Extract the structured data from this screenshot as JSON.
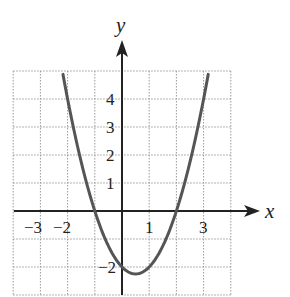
{
  "chart_data": {
    "type": "line",
    "title": "",
    "function": "y = x^2 - x - 2",
    "xlabel": "x",
    "ylabel": "y",
    "xlim": [
      -4,
      4
    ],
    "ylim": [
      -3,
      5
    ],
    "grid": true,
    "grid_style": "dotted",
    "x_tick_labels": [
      {
        "value": -3,
        "label": "−3"
      },
      {
        "value": -2,
        "label": "−2"
      },
      {
        "value": 1,
        "label": "1"
      },
      {
        "value": 3,
        "label": "3"
      }
    ],
    "y_tick_labels": [
      {
        "value": 4,
        "label": "4"
      },
      {
        "value": 3,
        "label": "3"
      },
      {
        "value": 2,
        "label": "2"
      },
      {
        "value": 1,
        "label": "1"
      },
      {
        "value": -2,
        "label": "−2"
      }
    ],
    "series": [
      {
        "name": "parabola",
        "x": [
          -2.17,
          -2,
          -1.5,
          -1,
          -0.5,
          0,
          0.5,
          1,
          1.5,
          2,
          2.5,
          3,
          3.17
        ],
        "y": [
          4.88,
          4,
          1.75,
          0,
          -1.25,
          -2,
          -2.25,
          -2,
          -1.25,
          0,
          1.75,
          4,
          4.88
        ]
      }
    ],
    "key_points": {
      "x_intercepts": [
        -1,
        2
      ],
      "y_intercept": -2,
      "vertex": [
        0.5,
        -2.25
      ]
    },
    "colors": {
      "curve": "#555555",
      "axes": "#222222",
      "grid": "#9a9a9a"
    }
  },
  "labels": {
    "x_axis": "x",
    "y_axis": "y",
    "x_ticks": [
      "−3",
      "−2",
      "1",
      "3"
    ],
    "y_ticks": [
      "4",
      "3",
      "2",
      "1",
      "−2"
    ]
  }
}
